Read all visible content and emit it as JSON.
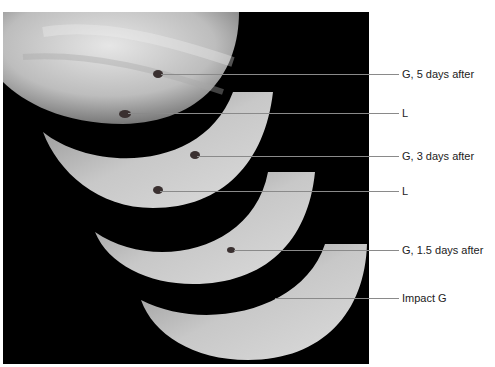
{
  "figure": {
    "panel_color": "#000000",
    "planet_color": "#d0d0d0",
    "spot_color": "#3a3030"
  },
  "annotations": [
    {
      "text": "G, 5 days after",
      "line_y": 74,
      "label_x": 402,
      "spot_x": 158
    },
    {
      "text": "L",
      "line_y": 113,
      "label_x": 402,
      "spot_x": 125
    },
    {
      "text": "G, 3 days after",
      "line_y": 156,
      "label_x": 402,
      "spot_x": 194
    },
    {
      "text": "L",
      "line_y": 191,
      "label_x": 402,
      "spot_x": 157
    },
    {
      "text": "G, 1.5 days after",
      "line_y": 250,
      "label_x": 402,
      "spot_x": 231
    },
    {
      "text": "Impact G",
      "line_y": 298,
      "label_x": 402,
      "spot_x": 272
    }
  ]
}
